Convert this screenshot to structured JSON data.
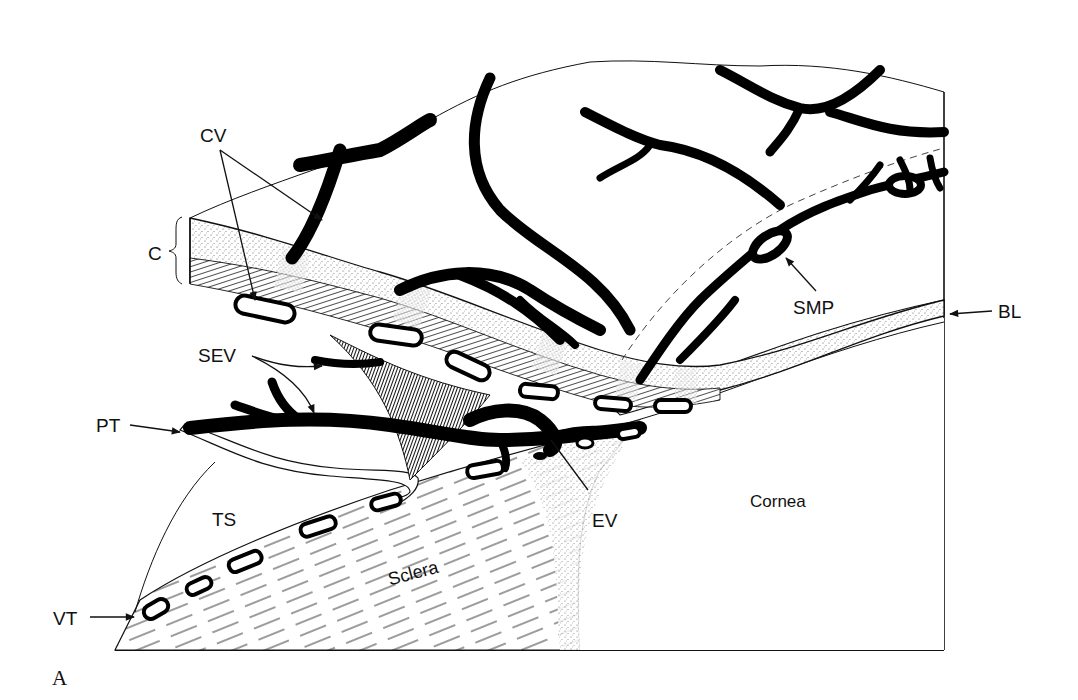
{
  "figure": {
    "panel_label": "A",
    "labels": {
      "cv": "CV",
      "c": "C",
      "sev": "SEV",
      "pt": "PT",
      "ts": "TS",
      "vt": "VT",
      "sclera": "Sclera",
      "ev": "EV",
      "cornea": "Cornea",
      "smp": "SMP",
      "bl": "BL"
    },
    "colors": {
      "ink": "#000000",
      "background": "#ffffff",
      "stipple": "#d8d8d8"
    }
  }
}
